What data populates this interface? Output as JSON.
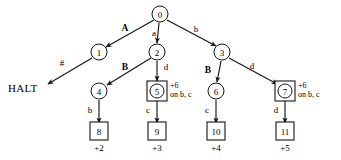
{
  "diagram": {
    "colors": {
      "stroke": "#151515",
      "node_fill": "#ffffff",
      "background": "#ffffff"
    },
    "terminal_text": "HALT",
    "nodes": [
      {
        "id": "n0",
        "label": "0",
        "x": 160,
        "y": 14,
        "shape": "circle",
        "r": 8
      },
      {
        "id": "n1",
        "label": "1",
        "x": 99,
        "y": 52,
        "shape": "circle",
        "r": 8
      },
      {
        "id": "n2",
        "label": "2",
        "x": 157,
        "y": 52,
        "shape": "circle",
        "r": 8
      },
      {
        "id": "n3",
        "label": "3",
        "x": 222,
        "y": 52,
        "shape": "circle",
        "r": 8
      },
      {
        "id": "n4",
        "label": "4",
        "x": 99,
        "y": 91,
        "shape": "circle",
        "r": 8
      },
      {
        "id": "n5",
        "label": "5",
        "x": 157,
        "y": 91,
        "shape": "boxed-circle",
        "r": 7
      },
      {
        "id": "n6",
        "label": "6",
        "x": 216,
        "y": 91,
        "shape": "circle",
        "r": 8
      },
      {
        "id": "n7",
        "label": "7",
        "x": 285,
        "y": 91,
        "shape": "boxed-circle",
        "r": 7
      },
      {
        "id": "n8",
        "label": "8",
        "x": 99,
        "y": 131,
        "shape": "box"
      },
      {
        "id": "n9",
        "label": "9",
        "x": 157,
        "y": 131,
        "shape": "box"
      },
      {
        "id": "n10",
        "label": "10",
        "x": 216,
        "y": 131,
        "shape": "box"
      },
      {
        "id": "n11",
        "label": "11",
        "x": 285,
        "y": 131,
        "shape": "box"
      }
    ],
    "edges": [
      {
        "id": "e-0-1",
        "from": "n0",
        "to": "n1",
        "label": "A",
        "bold": true,
        "label_x": 125,
        "label_y": 28,
        "x1": 154,
        "y1": 20,
        "x2": 106,
        "y2": 47
      },
      {
        "id": "e-0-2",
        "from": "n0",
        "to": "n2",
        "label": "a",
        "bold": false,
        "label_x": 154,
        "label_y": 33,
        "x1": 159,
        "y1": 23,
        "x2": 157,
        "y2": 43
      },
      {
        "id": "e-0-3",
        "from": "n0",
        "to": "n3",
        "label": "b",
        "bold": false,
        "label_x": 196,
        "label_y": 29,
        "x1": 167,
        "y1": 20,
        "x2": 216,
        "y2": 46
      },
      {
        "id": "e-1-halt",
        "from": "n1",
        "to": "halt",
        "label": "#",
        "bold": false,
        "label_x": 62,
        "label_y": 63,
        "x1": 92,
        "y1": 58,
        "x2": 48,
        "y2": 84
      },
      {
        "id": "e-2-4",
        "from": "n2",
        "to": "n4",
        "label": "B",
        "bold": true,
        "label_x": 125,
        "label_y": 67,
        "x1": 151,
        "y1": 58,
        "x2": 107,
        "y2": 85
      },
      {
        "id": "e-2-5",
        "from": "n2",
        "to": "n5",
        "label": "d",
        "bold": false,
        "label_x": 166,
        "label_y": 67,
        "x1": 157,
        "y1": 61,
        "x2": 157,
        "y2": 81
      },
      {
        "id": "e-3-6",
        "from": "n3",
        "to": "n6",
        "label": "B",
        "bold": true,
        "label_x": 208,
        "label_y": 70,
        "x1": 221,
        "y1": 61,
        "x2": 217,
        "y2": 82
      },
      {
        "id": "e-3-7",
        "from": "n3",
        "to": "n7",
        "label": "d",
        "bold": false,
        "label_x": 252,
        "label_y": 66,
        "x1": 229,
        "y1": 58,
        "x2": 277,
        "y2": 84
      },
      {
        "id": "e-4-8",
        "from": "n4",
        "to": "n8",
        "label": "b",
        "bold": false,
        "label_x": 90,
        "label_y": 110,
        "x1": 99,
        "y1": 100,
        "x2": 99,
        "y2": 123
      },
      {
        "id": "e-5-9",
        "from": "n5",
        "to": "n9",
        "label": "c",
        "bold": false,
        "label_x": 148,
        "label_y": 110,
        "x1": 157,
        "y1": 101,
        "x2": 157,
        "y2": 123
      },
      {
        "id": "e-6-10",
        "from": "n6",
        "to": "n10",
        "label": "c",
        "bold": false,
        "label_x": 207,
        "label_y": 110,
        "x1": 216,
        "y1": 100,
        "x2": 216,
        "y2": 123
      },
      {
        "id": "e-7-11",
        "from": "n7",
        "to": "n11",
        "label": "d",
        "bold": false,
        "label_x": 276,
        "label_y": 110,
        "x1": 285,
        "y1": 101,
        "x2": 285,
        "y2": 123
      }
    ],
    "annotations": [
      {
        "id": "a-n5",
        "for": "n5",
        "line1": "+6",
        "line2": "on b, c",
        "x": 170,
        "y": 85
      },
      {
        "id": "a-n7",
        "for": "n7",
        "line1": "+6",
        "line2": "on b, c",
        "x": 298,
        "y": 85
      }
    ],
    "costs": [
      {
        "id": "c-n8",
        "for": "n8",
        "label": "+2",
        "x": 99,
        "y": 148
      },
      {
        "id": "c-n9",
        "for": "n9",
        "label": "+3",
        "x": 157,
        "y": 148
      },
      {
        "id": "c-n10",
        "for": "n10",
        "label": "+4",
        "x": 216,
        "y": 148
      },
      {
        "id": "c-n11",
        "for": "n11",
        "label": "+5",
        "x": 285,
        "y": 148
      }
    ],
    "halt": {
      "x": 8,
      "y": 88,
      "label": "HALT"
    }
  }
}
